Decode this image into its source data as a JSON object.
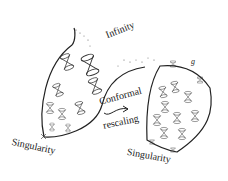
{
  "diagram": {
    "labels": {
      "infinity": "Infinity",
      "conformal": "Conformal",
      "rescaling": "rescaling",
      "singularity_left": "Singularity",
      "singularity_right": "Singularity",
      "metric_symbol": "g"
    },
    "colors": {
      "ink": "#222222",
      "background": "#ffffff"
    }
  }
}
